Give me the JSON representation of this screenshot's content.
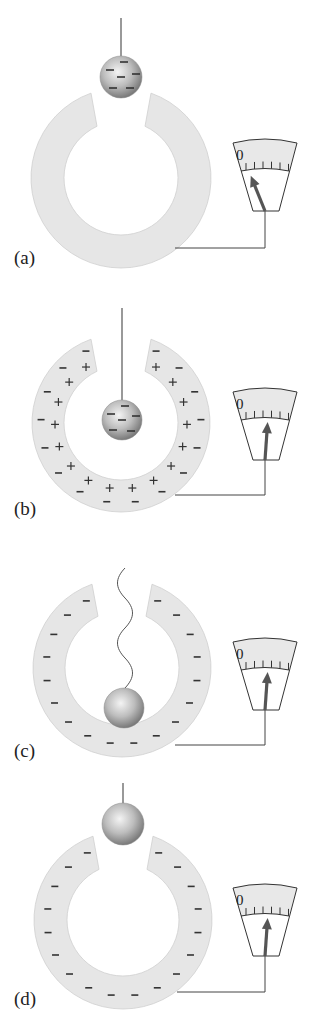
{
  "figure": {
    "width": 310,
    "height": 1023,
    "colors": {
      "background": "#ffffff",
      "ring_fill": "#e6e6e6",
      "ring_stroke": "#cfcfcf",
      "meter_scale_fill": "#e8e8e8",
      "meter_stroke": "#333333",
      "needle": "#555555",
      "wire": "#444444",
      "string": "#555555",
      "sign": "#333333",
      "ball_light": "#f2f2f2",
      "ball_mid": "#bdbdbd",
      "ball_dark": "#7a7a7a"
    },
    "meter_zero_label": "0",
    "panels": [
      {
        "id": "a",
        "label": "(a)",
        "label_pos": [
          14,
          264
        ],
        "ring": {
          "cx": 121,
          "cy": 178,
          "R": 90,
          "r": 57
        },
        "ring_charges": {
          "minus_outer": 0,
          "plus_inner": 0,
          "minus_only_band": 0
        },
        "ball": {
          "cx": 121,
          "cy": 77,
          "r": 21,
          "charged": true,
          "signs": [
            [
              124,
              62
            ],
            [
              110,
              70
            ],
            [
              136,
              74
            ],
            [
              121,
              77
            ],
            [
              113,
              88
            ],
            [
              130,
              88
            ]
          ]
        },
        "string": {
          "type": "straight",
          "from": [
            121,
            18
          ],
          "to": [
            121,
            56
          ]
        },
        "meter": {
          "y0": 143,
          "needle_angle_deg": -22
        },
        "wire": {
          "drop_to": 248,
          "ring_x": 175
        }
      },
      {
        "id": "b",
        "label": "(b)",
        "label_pos": [
          14,
          515
        ],
        "ring": {
          "cx": 121,
          "cy": 423,
          "R": 89,
          "r": 57
        },
        "ring_charges": {
          "minus_outer": 16,
          "plus_inner": 16,
          "minus_only_band": 0
        },
        "ball": {
          "cx": 122,
          "cy": 420,
          "r": 20,
          "charged": true,
          "signs": [
            [
              125,
              406
            ],
            [
              111,
              414
            ],
            [
              136,
              416
            ],
            [
              122,
              420
            ],
            [
              113,
              430
            ],
            [
              131,
              431
            ]
          ]
        },
        "string": {
          "type": "straight",
          "from": [
            122,
            308
          ],
          "to": [
            122,
            400
          ]
        },
        "meter": {
          "y0": 392,
          "needle_angle_deg": 4
        },
        "wire": {
          "drop_to": 495,
          "ring_x": 175
        }
      },
      {
        "id": "c",
        "label": "(c)",
        "label_pos": [
          14,
          757
        ],
        "ring": {
          "cx": 122,
          "cy": 668,
          "R": 89,
          "r": 57
        },
        "ring_charges": {
          "minus_outer": 0,
          "plus_inner": 0,
          "minus_only_band": 18
        },
        "ball": {
          "cx": 124,
          "cy": 708,
          "r": 20,
          "charged": false,
          "signs": []
        },
        "string": {
          "type": "wavy",
          "from": [
            125,
            568
          ],
          "to": [
            125,
            688
          ]
        },
        "meter": {
          "y0": 642,
          "needle_angle_deg": 4
        },
        "wire": {
          "drop_to": 745,
          "ring_x": 175
        }
      },
      {
        "id": "d",
        "label": "(d)",
        "label_pos": [
          14,
          1005
        ],
        "ring": {
          "cx": 123,
          "cy": 920,
          "R": 89,
          "r": 56
        },
        "ring_charges": {
          "minus_outer": 0,
          "plus_inner": 0,
          "minus_only_band": 18
        },
        "ball": {
          "cx": 123,
          "cy": 824,
          "r": 21,
          "charged": false,
          "signs": []
        },
        "string": {
          "type": "straight",
          "from": [
            123,
            783
          ],
          "to": [
            123,
            803
          ]
        },
        "meter": {
          "y0": 888,
          "needle_angle_deg": 4
        },
        "wire": {
          "drop_to": 992,
          "ring_x": 177
        }
      }
    ]
  }
}
